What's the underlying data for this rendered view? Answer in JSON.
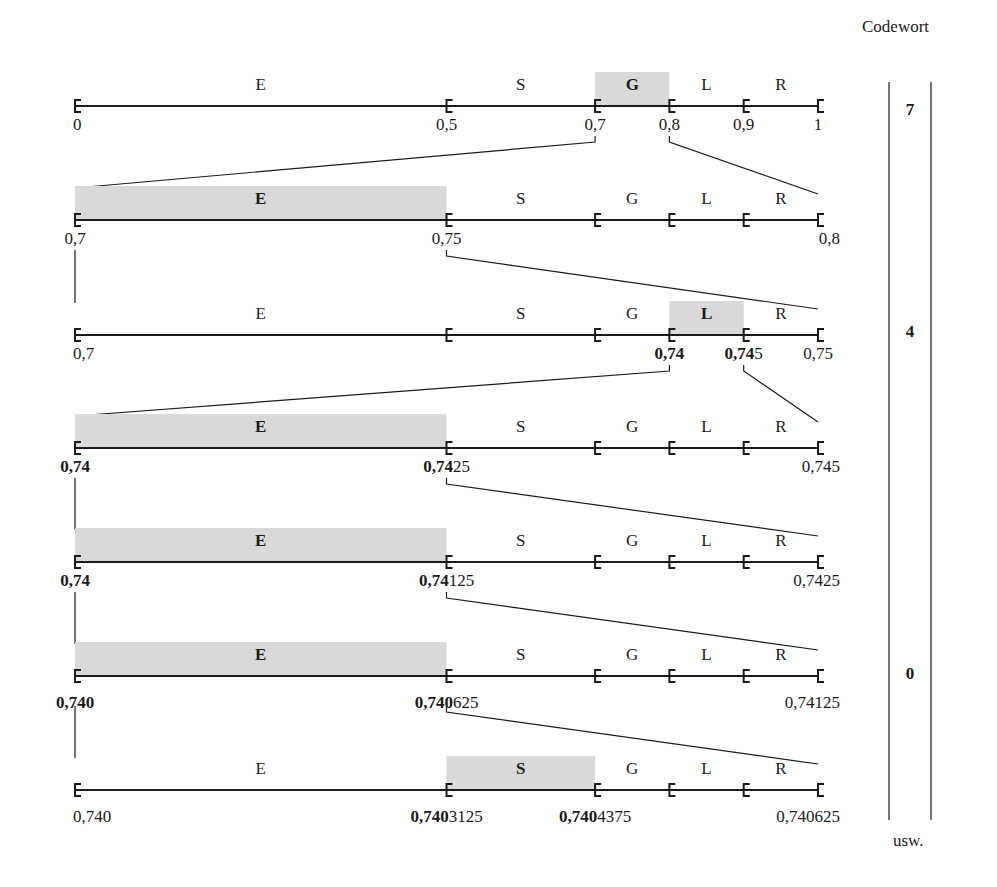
{
  "header": {
    "codewort_label": "Codewort"
  },
  "footer": {
    "usw_label": "usw."
  },
  "colors": {
    "highlight": "#d9d9d9",
    "line": "#1a1a1a",
    "background": "#ffffff"
  },
  "symbols": [
    "E",
    "S",
    "G",
    "L",
    "R"
  ],
  "probabilities": {
    "E": 0.5,
    "S": 0.2,
    "G": 0.1,
    "L": 0.1,
    "R": 0.1
  },
  "rows": [
    {
      "interval": [
        "0",
        "1"
      ],
      "selected": "G",
      "labels": [
        {
          "pos": 0.0,
          "bold": "",
          "normal": "0",
          "align": "left"
        },
        {
          "pos": 0.5,
          "bold": "",
          "normal": "0,5",
          "align": "center"
        },
        {
          "pos": 0.7,
          "bold": "",
          "normal": "0,7",
          "align": "center"
        },
        {
          "pos": 0.8,
          "bold": "",
          "normal": "0,8",
          "align": "center"
        },
        {
          "pos": 0.9,
          "bold": "",
          "normal": "0,9",
          "align": "center"
        },
        {
          "pos": 1.0,
          "bold": "",
          "normal": "1",
          "align": "center"
        }
      ]
    },
    {
      "interval": [
        "0,7",
        "0,8"
      ],
      "selected": "E",
      "labels": [
        {
          "pos": 0.0,
          "bold": "",
          "normal": "0,7",
          "align": "center"
        },
        {
          "pos": 0.5,
          "bold": "",
          "normal": "0,75",
          "align": "center"
        },
        {
          "pos": 1.0,
          "bold": "",
          "normal": "0,8",
          "align": "right"
        }
      ]
    },
    {
      "interval": [
        "0,7",
        "0,75"
      ],
      "selected": "L",
      "labels": [
        {
          "pos": 0.0,
          "bold": "",
          "normal": "0,7",
          "align": "left"
        },
        {
          "pos": 0.8,
          "bold": "0,74",
          "normal": "",
          "align": "center"
        },
        {
          "pos": 0.9,
          "bold": "0,74",
          "normal": "5",
          "align": "center"
        },
        {
          "pos": 1.0,
          "bold": "",
          "normal": "0,75",
          "align": "center"
        }
      ]
    },
    {
      "interval": [
        "0,74",
        "0,745"
      ],
      "selected": "E",
      "labels": [
        {
          "pos": 0.0,
          "bold": "0,74",
          "normal": "",
          "align": "center"
        },
        {
          "pos": 0.5,
          "bold": "0,74",
          "normal": "25",
          "align": "center"
        },
        {
          "pos": 1.0,
          "bold": "",
          "normal": "0,745",
          "align": "right"
        }
      ]
    },
    {
      "interval": [
        "0,74",
        "0,7425"
      ],
      "selected": "E",
      "labels": [
        {
          "pos": 0.0,
          "bold": "0,74",
          "normal": "",
          "align": "center"
        },
        {
          "pos": 0.5,
          "bold": "0,74",
          "normal": "125",
          "align": "center"
        },
        {
          "pos": 1.0,
          "bold": "",
          "normal": "0,7425",
          "align": "right"
        }
      ]
    },
    {
      "interval": [
        "0,740",
        "0,74125"
      ],
      "selected": "E",
      "labels": [
        {
          "pos": 0.0,
          "bold": "0,740",
          "normal": "",
          "align": "center"
        },
        {
          "pos": 0.5,
          "bold": "0,740",
          "normal": "625",
          "align": "center"
        },
        {
          "pos": 1.0,
          "bold": "",
          "normal": "0,74125",
          "align": "right"
        }
      ]
    },
    {
      "interval": [
        "0,740",
        "0,740625"
      ],
      "selected": "S",
      "labels": [
        {
          "pos": 0.0,
          "bold": "",
          "normal": "0,740",
          "align": "left"
        },
        {
          "pos": 0.5,
          "bold": "0,740",
          "normal": "3125",
          "align": "center"
        },
        {
          "pos": 0.7,
          "bold": "0,740",
          "normal": "4375",
          "align": "center"
        },
        {
          "pos": 1.0,
          "bold": "",
          "normal": "0,740625",
          "align": "right"
        }
      ]
    }
  ],
  "codewords": [
    {
      "digit": "7",
      "row": 0
    },
    {
      "digit": "4",
      "row": 2
    },
    {
      "digit": "0",
      "row": 5
    }
  ]
}
